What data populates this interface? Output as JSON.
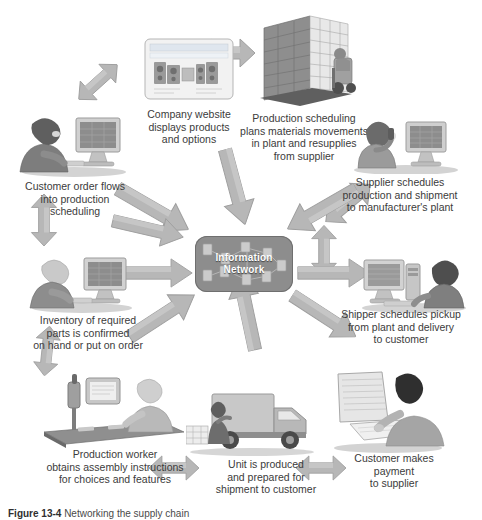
{
  "figure": {
    "center": {
      "line1": "Information",
      "line2": "Network",
      "name": "information-network-hub"
    },
    "nodes": [
      {
        "id": "company-website",
        "icon": "webpage-products-icon",
        "caption": "Company website\ndisplays products\nand options"
      },
      {
        "id": "production-scheduling",
        "icon": "warehouse-forklift-icon",
        "caption": "Production scheduling\nplans materials movements\nin plant and resupplies\nfrom supplier"
      },
      {
        "id": "supplier-schedules",
        "icon": "person-phone-computer-icon",
        "caption": "Supplier schedules\nproduction and shipment\nto manufacturer's plant"
      },
      {
        "id": "shipper-schedules",
        "icon": "person-computer-desk-icon",
        "caption": "Shipper schedules pickup\nfrom plant and delivery\nto customer"
      },
      {
        "id": "customer-payment",
        "icon": "person-writing-check-icon",
        "caption": "Customer makes\npayment\nto supplier"
      },
      {
        "id": "unit-produced",
        "icon": "delivery-truck-icon",
        "caption": "Unit is produced\nand prepared for\nshipment to customer"
      },
      {
        "id": "production-worker",
        "icon": "worker-terminal-icon",
        "caption": "Production worker\nobtains assembly instructions\nfor choices and features"
      },
      {
        "id": "inventory-parts",
        "icon": "person-computer-icon",
        "caption": "Inventory of required\nparts is confirmed\non hand or put on order"
      },
      {
        "id": "customer-order",
        "icon": "person-computer-icon",
        "caption": "Customer order flows\ninto production\nscheduling"
      }
    ],
    "arrows": [
      {
        "id": "arrow-website-to-production",
        "type": "double",
        "orientation": "horizontal"
      },
      {
        "id": "arrow-customer-to-website",
        "type": "double",
        "orientation": "diagonal-ne"
      },
      {
        "id": "arrow-production-to-supplier",
        "type": "double",
        "orientation": "diagonal-se"
      },
      {
        "id": "arrow-customer-order-vertical",
        "type": "double",
        "orientation": "vertical"
      },
      {
        "id": "arrow-supplier-to-shipper",
        "type": "double",
        "orientation": "vertical"
      },
      {
        "id": "arrow-worker-to-unit",
        "type": "double",
        "orientation": "horizontal"
      },
      {
        "id": "arrow-unit-to-payment",
        "type": "double",
        "orientation": "horizontal"
      },
      {
        "id": "arrow-inventory-to-worker",
        "type": "double",
        "orientation": "vertical"
      },
      {
        "id": "arrow-hub-in-nw",
        "type": "single",
        "orientation": "to-center"
      },
      {
        "id": "arrow-hub-in-n",
        "type": "single",
        "orientation": "to-center"
      },
      {
        "id": "arrow-hub-in-ne",
        "type": "single",
        "orientation": "to-center"
      },
      {
        "id": "arrow-hub-out-e",
        "type": "single",
        "orientation": "from-center"
      },
      {
        "id": "arrow-hub-out-se",
        "type": "single",
        "orientation": "from-center"
      },
      {
        "id": "arrow-hub-in-s",
        "type": "single",
        "orientation": "to-center"
      },
      {
        "id": "arrow-hub-in-sw",
        "type": "single",
        "orientation": "to-center"
      },
      {
        "id": "arrow-hub-in-w",
        "type": "single",
        "orientation": "to-center"
      },
      {
        "id": "arrow-hub-in-nw2",
        "type": "single",
        "orientation": "to-center"
      }
    ]
  },
  "caption": {
    "label": "Figure 13-4",
    "text": "Networking the supply chain"
  },
  "colors": {
    "arrow_fill": "#b9b9b9",
    "arrow_stroke": "#9a9a9a",
    "hub_fill": "#8d8d8d",
    "text": "#3b3b3b"
  }
}
